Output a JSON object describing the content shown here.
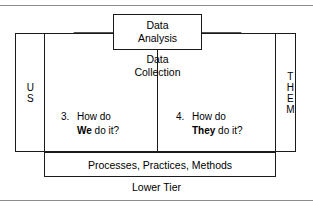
{
  "diagram": {
    "colors": {
      "funnel_fill": "#d2d2d2",
      "line": "#1a1a1a",
      "background": "#ffffff",
      "rule": "#8c8c8c"
    },
    "callout": {
      "line1": "Data",
      "line2": "Analysis"
    },
    "funnel_label": {
      "line1": "Data",
      "line2": "Collection"
    },
    "left_column": {
      "letters": [
        "U",
        "S"
      ]
    },
    "right_column": {
      "letters": [
        "T",
        "H",
        "E",
        "M"
      ]
    },
    "questions": [
      {
        "number": "3.",
        "line1": "How do",
        "emphasis": "We",
        "line2_rest": " do it?"
      },
      {
        "number": "4.",
        "line1": "How do",
        "emphasis": "They",
        "line2_rest": " do it?"
      }
    ],
    "lower_box_label": "Processes, Practices, Methods",
    "lower_tier_caption": "Lower Tier"
  }
}
